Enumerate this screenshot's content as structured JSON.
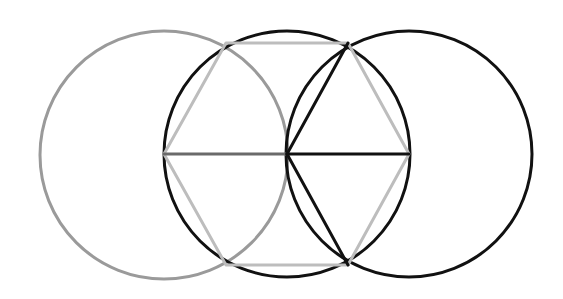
{
  "diagram": {
    "canvas": {
      "width": 563,
      "height": 299,
      "background": "#ffffff"
    },
    "circles": [
      {
        "id": "left-circle",
        "cx": 164,
        "cy": 155,
        "r": 124,
        "stroke": "#9a9a9a",
        "stroke_width": 3
      },
      {
        "id": "middle-circle",
        "cx": 287,
        "cy": 154,
        "r": 123,
        "stroke": "#111111",
        "stroke_width": 3
      },
      {
        "id": "right-circle",
        "cx": 409,
        "cy": 154,
        "r": 123,
        "stroke": "#111111",
        "stroke_width": 3
      }
    ],
    "hexagon": {
      "id": "inscribed-hexagon",
      "stroke": "#bdbdbd",
      "stroke_width": 3,
      "vertices": [
        [
          164,
          154
        ],
        [
          226,
          43
        ],
        [
          348,
          43
        ],
        [
          409,
          154
        ],
        [
          348,
          265
        ],
        [
          226,
          265
        ]
      ]
    },
    "lines": [
      {
        "id": "left-radius",
        "x1": 164,
        "y1": 154,
        "x2": 287,
        "y2": 154,
        "stroke": "#6a6a6a",
        "stroke_width": 3
      },
      {
        "id": "right-radius",
        "x1": 287,
        "y1": 154,
        "x2": 409,
        "y2": 154,
        "stroke": "#111111",
        "stroke_width": 3
      },
      {
        "id": "upper-chord",
        "x1": 287,
        "y1": 154,
        "x2": 348,
        "y2": 43,
        "stroke": "#111111",
        "stroke_width": 3
      },
      {
        "id": "lower-chord",
        "x1": 287,
        "y1": 154,
        "x2": 348,
        "y2": 265,
        "stroke": "#111111",
        "stroke_width": 3
      }
    ]
  }
}
